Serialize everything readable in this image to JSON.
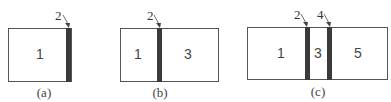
{
  "diagrams": [
    {
      "caption": "(a)",
      "regions": [
        "1"
      ],
      "layers": [
        "2"
      ]
    },
    {
      "caption": "(b)",
      "regions": [
        "1",
        "3"
      ],
      "layers": [
        "2"
      ]
    },
    {
      "caption": "(c)",
      "regions": [
        "1",
        "3",
        "5"
      ],
      "layers": [
        "2",
        "4"
      ]
    }
  ],
  "colors": {
    "layer": "#3a3a3a",
    "border": "#555555"
  }
}
